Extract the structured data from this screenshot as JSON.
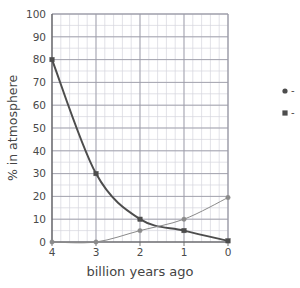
{
  "chart_data": {
    "type": "line",
    "title": "",
    "xlabel": "billion years ago",
    "ylabel": "% in atmosphere",
    "x": [
      4,
      3,
      2,
      1,
      0
    ],
    "xticklabels": [
      "4",
      "3",
      "2",
      "1",
      "0"
    ],
    "yticklabels": [
      "0",
      "10",
      "20",
      "30",
      "40",
      "50",
      "60",
      "70",
      "80",
      "90",
      "100"
    ],
    "xlim": [
      4,
      0
    ],
    "ylim": [
      0,
      100
    ],
    "x_reversed": true,
    "grid": true,
    "grid_minor": true,
    "grid_minor_x_subdivisions": 5,
    "grid_minor_y_subdivisions": 2,
    "legend_position": "right-outside",
    "series": [
      {
        "name": "series-squares",
        "marker": "square",
        "values": [
          80,
          30,
          10,
          5,
          0.5
        ],
        "color": "#4d4d4d",
        "linewidth": 2.0,
        "legend_label": "-"
      },
      {
        "name": "series-circles",
        "marker": "circle",
        "values": [
          0,
          0,
          5,
          10,
          19.5
        ],
        "color": "#8a8a8a",
        "linewidth": 1.0,
        "legend_label": "-"
      }
    ]
  },
  "axes": {
    "y_ticks": [
      0,
      10,
      20,
      30,
      40,
      50,
      60,
      70,
      80,
      90,
      100
    ],
    "x_ticks": [
      4,
      3,
      2,
      1,
      0
    ]
  },
  "colors": {
    "background": "#ffffff",
    "axis": "#555555",
    "grid_major": "#9a9aa5",
    "grid_minor": "#d6d6de",
    "text": "#444444",
    "series_dark": "#4d4d4d",
    "series_light": "#8a8a8a"
  },
  "legend": {
    "entries": [
      {
        "marker": "circle-marker",
        "dash": "-"
      },
      {
        "marker": "square-marker",
        "dash": "-"
      }
    ]
  }
}
